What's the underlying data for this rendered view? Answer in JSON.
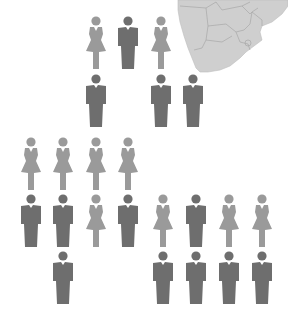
{
  "colors": {
    "female": "#9a9a9a",
    "male": "#6e6e6e",
    "map_fill": "#cfcfcf",
    "map_border": "#a8a8a8"
  },
  "map": {
    "region": "southern-africa-map"
  },
  "groups": [
    {
      "name": "top-group",
      "figures": [
        {
          "type": "female",
          "x": 84,
          "y": 16
        },
        {
          "type": "male",
          "x": 116,
          "y": 16
        },
        {
          "type": "female",
          "x": 149,
          "y": 16
        },
        {
          "type": "male",
          "x": 84,
          "y": 74
        },
        {
          "type": "male",
          "x": 149,
          "y": 74
        },
        {
          "type": "male",
          "x": 181,
          "y": 74
        }
      ]
    },
    {
      "name": "left-group",
      "figures": [
        {
          "type": "female",
          "x": 19,
          "y": 137
        },
        {
          "type": "female",
          "x": 51,
          "y": 137
        },
        {
          "type": "female",
          "x": 84,
          "y": 137
        },
        {
          "type": "female",
          "x": 116,
          "y": 137
        },
        {
          "type": "male",
          "x": 19,
          "y": 194
        },
        {
          "type": "male",
          "x": 51,
          "y": 194
        },
        {
          "type": "female",
          "x": 84,
          "y": 194
        },
        {
          "type": "male",
          "x": 116,
          "y": 194
        },
        {
          "type": "male",
          "x": 51,
          "y": 251
        }
      ]
    },
    {
      "name": "right-group",
      "figures": [
        {
          "type": "female",
          "x": 151,
          "y": 194
        },
        {
          "type": "male",
          "x": 184,
          "y": 194
        },
        {
          "type": "female",
          "x": 217,
          "y": 194
        },
        {
          "type": "female",
          "x": 250,
          "y": 194
        },
        {
          "type": "male",
          "x": 151,
          "y": 251
        },
        {
          "type": "male",
          "x": 184,
          "y": 251
        },
        {
          "type": "male",
          "x": 217,
          "y": 251
        },
        {
          "type": "male",
          "x": 250,
          "y": 251
        }
      ]
    }
  ]
}
